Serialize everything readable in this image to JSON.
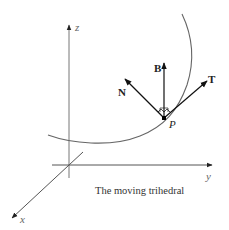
{
  "figure": {
    "caption": "The moving trihedral",
    "axes": {
      "x_label": "x",
      "y_label": "y",
      "z_label": "z"
    },
    "vectors": {
      "tangent_label": "T",
      "normal_label": "N",
      "binormal_label": "B"
    },
    "point_label": "P",
    "colors": {
      "axis": "#555555",
      "curve": "#666666",
      "vector": "#111111",
      "background": "#ffffff"
    }
  }
}
